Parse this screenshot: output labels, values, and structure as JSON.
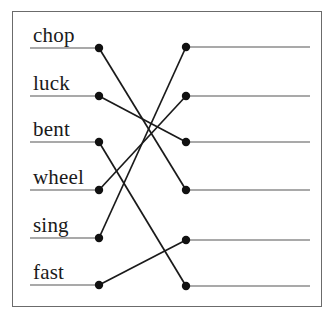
{
  "worksheet": {
    "type": "matching-exercise",
    "border_color": "#6b6b6b",
    "rule_color": "#8c8c8c",
    "connector_color": "#1a1a1a",
    "node_color": "#111111",
    "left_column": {
      "items": [
        {
          "label": "chop",
          "row": 1,
          "text_x": 33,
          "text_y": 42,
          "rule_x1": 30,
          "rule_x2": 99,
          "rule_y": 48,
          "node_x": 99,
          "node_y": 48
        },
        {
          "label": "luck",
          "row": 2,
          "text_x": 33,
          "text_y": 90,
          "rule_x1": 30,
          "rule_x2": 99,
          "rule_y": 96,
          "node_x": 99,
          "node_y": 96
        },
        {
          "label": "bent",
          "row": 3,
          "text_x": 33,
          "text_y": 136,
          "rule_x1": 30,
          "rule_x2": 99,
          "rule_y": 142,
          "node_x": 99,
          "node_y": 142
        },
        {
          "label": "wheel",
          "row": 4,
          "text_x": 33,
          "text_y": 184,
          "rule_x1": 30,
          "rule_x2": 99,
          "rule_y": 190,
          "node_x": 99,
          "node_y": 190
        },
        {
          "label": "sing",
          "row": 5,
          "text_x": 33,
          "text_y": 232,
          "rule_x1": 30,
          "rule_x2": 99,
          "rule_y": 238,
          "node_x": 99,
          "node_y": 238
        },
        {
          "label": "fast",
          "row": 6,
          "text_x": 33,
          "text_y": 279,
          "rule_x1": 30,
          "rule_x2": 99,
          "rule_y": 285,
          "node_x": 99,
          "node_y": 285
        }
      ]
    },
    "right_column": {
      "items": [
        {
          "label": "",
          "row": 1,
          "rule_x1": 186,
          "rule_x2": 310,
          "rule_y": 47,
          "node_x": 186,
          "node_y": 47
        },
        {
          "label": "",
          "row": 2,
          "rule_x1": 186,
          "rule_x2": 310,
          "rule_y": 96,
          "node_x": 186,
          "node_y": 96
        },
        {
          "label": "",
          "row": 3,
          "rule_x1": 186,
          "rule_x2": 310,
          "rule_y": 142,
          "node_x": 186,
          "node_y": 142
        },
        {
          "label": "",
          "row": 4,
          "rule_x1": 186,
          "rule_x2": 310,
          "rule_y": 190,
          "node_x": 186,
          "node_y": 190
        },
        {
          "label": "",
          "row": 5,
          "rule_x1": 186,
          "rule_x2": 310,
          "rule_y": 240,
          "node_x": 186,
          "node_y": 240
        },
        {
          "label": "",
          "row": 6,
          "rule_x1": 186,
          "rule_x2": 310,
          "rule_y": 286,
          "node_x": 186,
          "node_y": 286
        }
      ]
    },
    "connections": [
      {
        "from_word": "chop",
        "from_row": 1,
        "to_row": 4,
        "x1": 99,
        "y1": 48,
        "x2": 186,
        "y2": 190
      },
      {
        "from_word": "luck",
        "from_row": 2,
        "to_row": 3,
        "x1": 99,
        "y1": 96,
        "x2": 186,
        "y2": 142
      },
      {
        "from_word": "bent",
        "from_row": 3,
        "to_row": 6,
        "x1": 99,
        "y1": 142,
        "x2": 186,
        "y2": 286
      },
      {
        "from_word": "wheel",
        "from_row": 4,
        "to_row": 2,
        "x1": 99,
        "y1": 190,
        "x2": 186,
        "y2": 96
      },
      {
        "from_word": "sing",
        "from_row": 5,
        "to_row": 1,
        "x1": 99,
        "y1": 238,
        "x2": 186,
        "y2": 47
      },
      {
        "from_word": "fast",
        "from_row": 6,
        "to_row": 5,
        "x1": 99,
        "y1": 285,
        "x2": 186,
        "y2": 240
      }
    ]
  }
}
